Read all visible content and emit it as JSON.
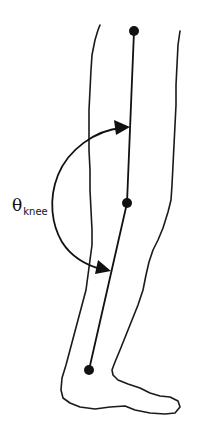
{
  "figure": {
    "label": {
      "symbol": "θ",
      "subscript": "knee"
    },
    "markers": [
      {
        "name": "hip-marker",
        "x": 134,
        "y": 31
      },
      {
        "name": "knee-marker",
        "x": 127,
        "y": 203
      },
      {
        "name": "ankle-marker",
        "x": 89,
        "y": 370
      }
    ],
    "colors": {
      "line": "#111111",
      "background": "#ffffff"
    }
  }
}
